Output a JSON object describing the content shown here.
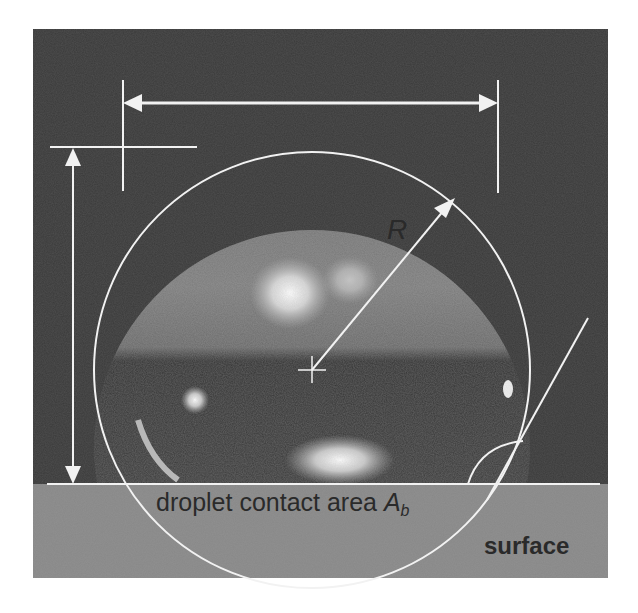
{
  "figure": {
    "labels": {
      "radius": "R",
      "contact_area_prefix": "droplet contact area ",
      "contact_area_symbol": "A",
      "contact_area_subscript": "b",
      "surface": "surface"
    },
    "colors": {
      "background_dark": "#3a3a3a",
      "droplet_upper": "#7a7a7a",
      "droplet_lower": "#323232",
      "surface": "#8a8a8a",
      "annotation": "#f2f2f2",
      "text": "#2a2a2a"
    }
  }
}
